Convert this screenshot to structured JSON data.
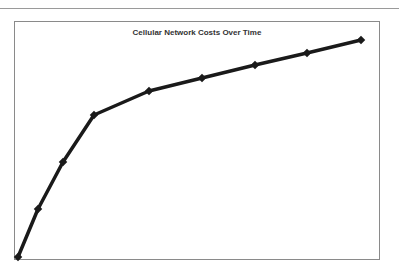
{
  "chart_data": {
    "type": "line",
    "title": "Cellular Network Costs Over Time",
    "xlabel": "",
    "ylabel": "",
    "grid": false,
    "legend": null,
    "x": [
      0,
      1,
      2,
      3,
      4,
      5,
      6,
      7,
      8
    ],
    "series": [
      {
        "name": "Cost",
        "color": "#1a1a1a",
        "values": [
          0,
          20,
          40,
          60,
          70,
          75.5,
          81,
          86,
          91
        ]
      }
    ],
    "ylim": [
      0,
      100
    ],
    "pixel_points": [
      [
        18,
        257
      ],
      [
        38,
        209
      ],
      [
        63,
        162
      ],
      [
        94,
        115
      ],
      [
        149,
        91
      ],
      [
        202,
        78
      ],
      [
        255,
        65
      ],
      [
        307,
        53
      ],
      [
        361,
        40
      ]
    ]
  },
  "style": {
    "line_color": "#1a1a1a",
    "frame_color": "#8a8a8a"
  }
}
